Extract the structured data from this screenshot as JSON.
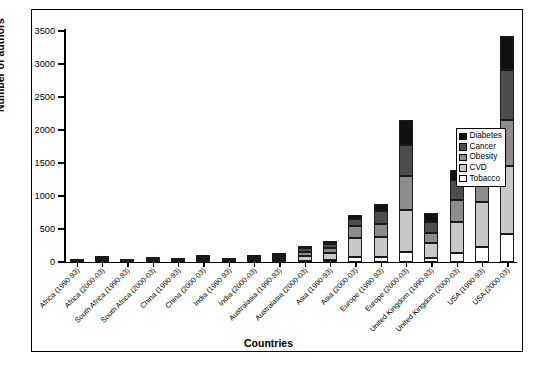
{
  "chart_data": {
    "type": "bar",
    "subtype": "stacked-bar",
    "title": "",
    "xlabel": "Countries",
    "ylabel": "Number of authors",
    "ylim": [
      0,
      3500
    ],
    "yticks": [
      0,
      500,
      1000,
      1500,
      2000,
      2500,
      3000,
      3500
    ],
    "grid": false,
    "legend_position": "right-inside",
    "categories": [
      "Africa (1990-93)",
      "Africa (2000-03)",
      "South Africa (1990-93)",
      "South Africa (2000-03)",
      "China (1990-93)",
      "China (2000-03)",
      "India (1990-93)",
      "India (2000-03)",
      "Australasia (1990-93)",
      "Australasia (2000-03)",
      "Asia (1990-93)",
      "Asia (2000-03)",
      "Europe (1990-93)",
      "Europe (2000-03)",
      "United Kingdom (1990-93)",
      "United Kingdom (2000-03)",
      "USA (1990-93)",
      "USA (2000-03)"
    ],
    "series": [
      {
        "name": "Tobacco",
        "color": "#ffffff",
        "values": [
          2,
          6,
          2,
          4,
          2,
          5,
          2,
          6,
          10,
          22,
          30,
          70,
          80,
          150,
          60,
          130,
          230,
          420
        ]
      },
      {
        "name": "CVD",
        "color": "#c8c8c8",
        "values": [
          8,
          22,
          4,
          14,
          10,
          26,
          8,
          28,
          40,
          70,
          110,
          290,
          300,
          640,
          230,
          480,
          680,
          1030
        ]
      },
      {
        "name": "Obesity",
        "color": "#8c8c8c",
        "values": [
          4,
          14,
          3,
          10,
          8,
          20,
          6,
          20,
          25,
          55,
          70,
          180,
          200,
          520,
          150,
          330,
          400,
          700
        ]
      },
      {
        "name": "Cancer",
        "color": "#4d4d4d",
        "values": [
          6,
          18,
          3,
          12,
          10,
          24,
          8,
          26,
          30,
          60,
          70,
          110,
          190,
          470,
          170,
          300,
          390,
          760
        ]
      },
      {
        "name": "Diabetes",
        "color": "#111111",
        "values": [
          5,
          20,
          3,
          10,
          10,
          25,
          6,
          20,
          25,
          43,
          40,
          70,
          110,
          370,
          140,
          160,
          200,
          510
        ]
      }
    ],
    "totals": [
      25,
      80,
      15,
      50,
      40,
      100,
      30,
      100,
      130,
      250,
      320,
      720,
      880,
      2150,
      750,
      1400,
      1900,
      3420
    ]
  },
  "legend": {
    "items": [
      {
        "label": "Diabetes",
        "color": "#111111"
      },
      {
        "label": "Cancer",
        "color": "#4d4d4d"
      },
      {
        "label": "Obesity",
        "color": "#8c8c8c"
      },
      {
        "label": "CVD",
        "color": "#c8c8c8"
      },
      {
        "label": "Tobacco",
        "color": "#ffffff"
      }
    ]
  },
  "axes": {
    "y_title": "Number of authors",
    "x_title": "Countries"
  },
  "caption": {
    "text": ""
  }
}
